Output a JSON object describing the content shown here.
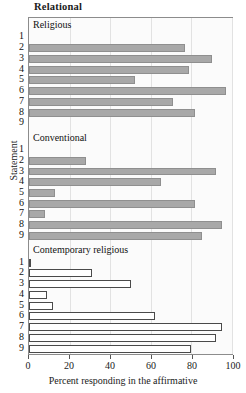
{
  "chart_data": {
    "type": "bar",
    "orientation": "horizontal",
    "title": "Relational",
    "xlabel": "Percent responding in the affirmative",
    "ylabel": "Statement",
    "xlim": [
      0,
      100
    ],
    "xticks": [
      0,
      20,
      40,
      60,
      80,
      100
    ],
    "xtick_labels": [
      "0",
      "20",
      "40",
      "60",
      "80",
      "100"
    ],
    "grid": true,
    "legend": "none",
    "categories": [
      "1",
      "2",
      "3",
      "4",
      "5",
      "6",
      "7",
      "8",
      "9"
    ],
    "panels": [
      {
        "name": "Religious",
        "style": "filled",
        "fill_color": "#a8a8a8",
        "edge_color": "#8f8f8f",
        "values": [
          0,
          77,
          90,
          79,
          52,
          97,
          71,
          82,
          0
        ]
      },
      {
        "name": "Conventional",
        "style": "filled",
        "fill_color": "#a8a8a8",
        "edge_color": "#8f8f8f",
        "values": [
          0,
          28,
          92,
          65,
          13,
          82,
          8,
          95,
          85
        ]
      },
      {
        "name": "Contemporary religious",
        "style": "hollow",
        "fill_color": "#ffffff",
        "edge_color": "#4a4a4a",
        "values": [
          1,
          31,
          50,
          9,
          12,
          62,
          95,
          92,
          80
        ]
      }
    ]
  },
  "colors": {
    "filled_bar": "#a8a8a8",
    "hollow_bar": "#ffffff",
    "hollow_edge": "#4a4a4a",
    "gridline": "#e2e2e2",
    "frame": "#8c8c8c",
    "text": "#1a1a1a"
  }
}
